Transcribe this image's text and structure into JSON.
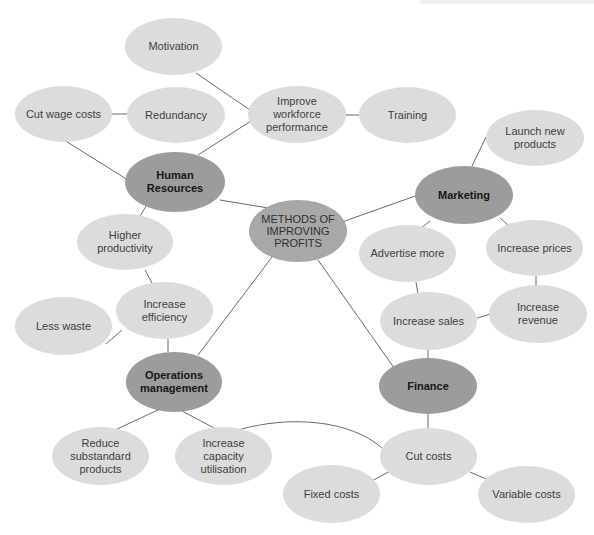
{
  "diagram": {
    "type": "mind-map",
    "center": {
      "id": "methods",
      "label": "METHODS OF\nIMPROVING\nPROFITS"
    },
    "nodes": [
      {
        "id": "methods",
        "label": "METHODS OF\nIMPROVING\nPROFITS",
        "level": "center"
      },
      {
        "id": "hr",
        "label": "Human Resources",
        "level": "category"
      },
      {
        "id": "marketing",
        "label": "Marketing",
        "level": "category"
      },
      {
        "id": "ops",
        "label": "Operations\nmanagement",
        "level": "category"
      },
      {
        "id": "finance",
        "label": "Finance",
        "level": "category"
      },
      {
        "id": "motivation",
        "label": "Motivation",
        "level": "leaf"
      },
      {
        "id": "cut_wage",
        "label": "Cut wage costs",
        "level": "leaf"
      },
      {
        "id": "redundancy",
        "label": "Redundancy",
        "level": "leaf"
      },
      {
        "id": "improve_wf",
        "label": "Improve\nworkforce\nperformance",
        "level": "leaf"
      },
      {
        "id": "training",
        "label": "Training",
        "level": "leaf"
      },
      {
        "id": "launch",
        "label": "Launch new\nproducts",
        "level": "leaf"
      },
      {
        "id": "higher_prod",
        "label": "Higher\nproductivity",
        "level": "leaf"
      },
      {
        "id": "advertise",
        "label": "Advertise more",
        "level": "leaf"
      },
      {
        "id": "inc_prices",
        "label": "Increase prices",
        "level": "leaf"
      },
      {
        "id": "inc_eff",
        "label": "Increase efficiency",
        "level": "leaf"
      },
      {
        "id": "inc_sales",
        "label": "Increase sales",
        "level": "leaf"
      },
      {
        "id": "inc_rev",
        "label": "Increase\nrevenue",
        "level": "leaf"
      },
      {
        "id": "less_waste",
        "label": "Less waste",
        "level": "leaf"
      },
      {
        "id": "reduce_sub",
        "label": "Reduce\nsubstandard\nproducts",
        "level": "leaf"
      },
      {
        "id": "inc_cap",
        "label": "Increase\ncapacity\nutilisation",
        "level": "leaf"
      },
      {
        "id": "cut_costs",
        "label": "Cut costs",
        "level": "leaf"
      },
      {
        "id": "fixed",
        "label": "Fixed costs",
        "level": "leaf"
      },
      {
        "id": "variable",
        "label": "Variable costs",
        "level": "leaf"
      }
    ],
    "edges": [
      [
        "methods",
        "hr"
      ],
      [
        "methods",
        "marketing"
      ],
      [
        "methods",
        "ops"
      ],
      [
        "methods",
        "finance"
      ],
      [
        "hr",
        "cut_wage"
      ],
      [
        "hr",
        "improve_wf"
      ],
      [
        "hr",
        "higher_prod"
      ],
      [
        "cut_wage",
        "redundancy"
      ],
      [
        "improve_wf",
        "motivation"
      ],
      [
        "improve_wf",
        "training"
      ],
      [
        "marketing",
        "launch"
      ],
      [
        "marketing",
        "advertise"
      ],
      [
        "marketing",
        "inc_prices"
      ],
      [
        "advertise",
        "inc_sales"
      ],
      [
        "inc_prices",
        "inc_rev"
      ],
      [
        "inc_sales",
        "inc_rev"
      ],
      [
        "inc_sales",
        "finance"
      ],
      [
        "higher_prod",
        "inc_eff"
      ],
      [
        "inc_eff",
        "less_waste"
      ],
      [
        "inc_eff",
        "ops"
      ],
      [
        "ops",
        "reduce_sub"
      ],
      [
        "ops",
        "inc_cap"
      ],
      [
        "inc_cap",
        "cut_costs"
      ],
      [
        "finance",
        "cut_costs"
      ],
      [
        "cut_costs",
        "fixed"
      ],
      [
        "cut_costs",
        "variable"
      ]
    ]
  },
  "labels": {
    "methods": "METHODS OF\nIMPROVING\nPROFITS",
    "hr": "Human Resources",
    "marketing": "Marketing",
    "ops": "Operations\nmanagement",
    "finance": "Finance",
    "motivation": "Motivation",
    "cut_wage": "Cut wage costs",
    "redundancy": "Redundancy",
    "improve_wf": "Improve\nworkforce\nperformance",
    "training": "Training",
    "launch": "Launch new\nproducts",
    "higher_prod": "Higher\nproductivity",
    "advertise": "Advertise more",
    "inc_prices": "Increase prices",
    "inc_eff": "Increase efficiency",
    "inc_sales": "Increase sales",
    "inc_rev": "Increase\nrevenue",
    "less_waste": "Less waste",
    "reduce_sub": "Reduce\nsubstandard\nproducts",
    "inc_cap": "Increase\ncapacity\nutilisation",
    "cut_costs": "Cut costs",
    "fixed": "Fixed costs",
    "variable": "Variable costs"
  },
  "colors": {
    "leaf": "#dcdcdc",
    "category": "#9c9c9c",
    "center": "#a8a8a8",
    "line": "#555555"
  }
}
